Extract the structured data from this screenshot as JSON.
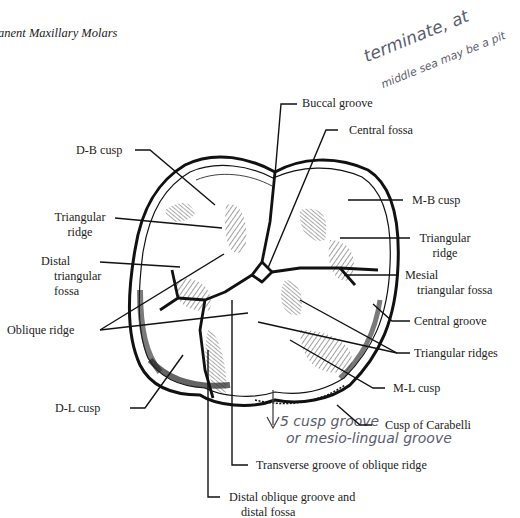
{
  "title": "anent Maxillary Molars",
  "labels": {
    "buccal_groove": "Buccal groove",
    "central_fossa": "Central fossa",
    "db_cusp": "D-B cusp",
    "mb_cusp": "M-B cusp",
    "triangular_ridge_left_1": "Triangular",
    "triangular_ridge_left_2": "ridge",
    "triangular_ridge_right_1": "Triangular",
    "triangular_ridge_right_2": "ridge",
    "distal_triangular_fossa_1": "Distal",
    "distal_triangular_fossa_2": "triangular",
    "distal_triangular_fossa_3": "fossa",
    "mesial_triangular_fossa_1": "Mesial",
    "mesial_triangular_fossa_2": "triangular fossa",
    "oblique_ridge": "Oblique ridge",
    "central_groove": "Central groove",
    "triangular_ridges": "Triangular ridges",
    "ml_cusp": "M-L cusp",
    "dl_cusp": "D-L cusp",
    "cusp_of_carabelli": "Cusp of Carabelli",
    "transverse_groove": "Transverse groove of oblique ridge",
    "distal_oblique_groove_1": "Distal oblique groove and",
    "distal_oblique_groove_2": "distal fossa"
  },
  "handwritten": {
    "top_note_line1": "terminate, at",
    "top_note_line2": "middle sea may be a pit",
    "bottom_note_line1": "5 cusp groove",
    "bottom_note_line2": "or mesio-lingual groove"
  },
  "colors": {
    "ink": "#1a1a1a",
    "pencil": "#5b5b6e",
    "background": "#ffffff"
  }
}
